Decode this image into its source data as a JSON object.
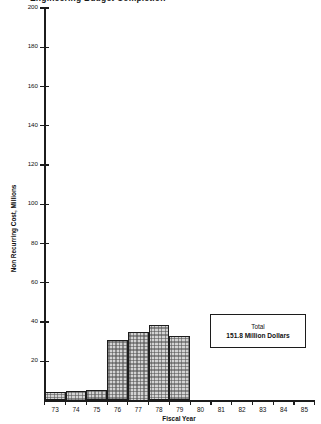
{
  "chart_data": {
    "type": "bar",
    "title": "Engineering Budget Completion",
    "xlabel": "Fiscal Year",
    "ylabel": "Non Recurring Cost, Millions",
    "categories": [
      "73",
      "74",
      "75",
      "76",
      "77",
      "78",
      "79",
      "80",
      "81",
      "82",
      "83",
      "84",
      "85"
    ],
    "values": [
      4.5,
      5.0,
      5.5,
      31.0,
      35.0,
      38.5,
      33.0,
      0,
      0,
      0,
      0,
      0,
      0
    ],
    "ylim": [
      0,
      200
    ],
    "ytick_values": [
      0,
      20,
      40,
      60,
      80,
      100,
      120,
      140,
      160,
      180,
      200
    ],
    "ytick_labels": [
      "",
      "20",
      "40",
      "60",
      "80",
      "100",
      "120",
      "140",
      "160",
      "180",
      "200"
    ],
    "grid": false,
    "legend": "none",
    "annotations": [
      {
        "name": "total-callout",
        "line1": "Total",
        "line2": "151.8 Million Dollars"
      }
    ]
  },
  "colors": {
    "axis": "#1c1c1c",
    "bar_fill": "#d3d3d3",
    "bar_edge": "#1c1c1c",
    "background": "#ffffff",
    "text": "#111111"
  }
}
